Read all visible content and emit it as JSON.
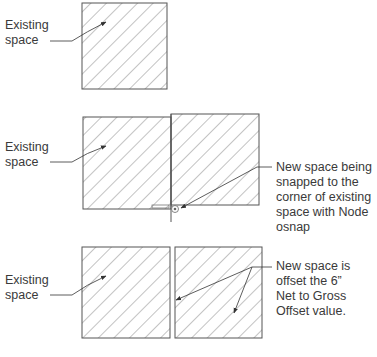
{
  "colors": {
    "line": "#555555",
    "hatch": "#7a7a7a",
    "text": "#3a3a3a",
    "background": "#ffffff"
  },
  "panels": [
    {
      "id": "panel-1",
      "left_label": "Existing\nspace",
      "boxes": [
        {
          "x": 82,
          "y": 3,
          "w": 85,
          "h": 86
        }
      ]
    },
    {
      "id": "panel-2",
      "left_label": "Existing\nspace",
      "right_label": "New space being\nsnapped to the\ncorner of existing\nspace with Node\nosnap",
      "boxes": [
        {
          "x": 83,
          "y": 117,
          "w": 88,
          "h": 92
        },
        {
          "x": 171,
          "y": 114,
          "w": 88,
          "h": 91
        }
      ],
      "snap_marker": "node-osnap-icon"
    },
    {
      "id": "panel-3",
      "left_label": "Existing\nspace",
      "right_label": "New space is\noffset the 6”\nNet to Gross\nOffset value.",
      "boxes": [
        {
          "x": 82,
          "y": 247,
          "w": 88,
          "h": 91
        },
        {
          "x": 175,
          "y": 247,
          "w": 87,
          "h": 91
        }
      ]
    }
  ]
}
